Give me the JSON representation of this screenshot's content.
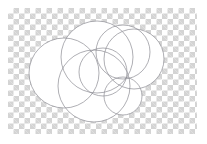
{
  "image": {
    "width": 207,
    "height": 144,
    "background_kind": "transparency-checkerboard",
    "outer_margin_color": "#ffffff",
    "checker": {
      "light_color": "#ffffff",
      "dark_color": "#d4d4d4",
      "cell_size_px": 5.5,
      "region": {
        "x": 8,
        "y": 8,
        "width": 189,
        "height": 126
      }
    },
    "artwork": {
      "title": "overlapping circles outline sketch",
      "fill_color": "#ffffff",
      "stroke_color": "#8c8c93",
      "stroke_width": 0.7,
      "shape_count": 7
    }
  },
  "shapes": [
    {
      "name": "circle-large-left",
      "cx": 64,
      "cy": 73,
      "r": 35
    },
    {
      "name": "circle-large-top-center",
      "cx": 97,
      "cy": 57,
      "r": 36
    },
    {
      "name": "circle-large-bottom-center",
      "cx": 94,
      "cy": 86,
      "r": 36
    },
    {
      "name": "circle-medium-upper-right",
      "cx": 123,
      "cy": 52,
      "r": 27
    },
    {
      "name": "circle-large-right",
      "cx": 134,
      "cy": 59,
      "r": 30
    },
    {
      "name": "circle-small-bottom-right",
      "cx": 123,
      "cy": 96,
      "r": 19
    },
    {
      "name": "circle-medium-center",
      "cx": 103,
      "cy": 72,
      "r": 24
    }
  ]
}
